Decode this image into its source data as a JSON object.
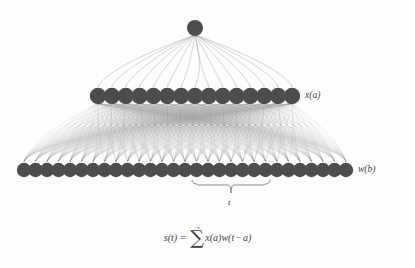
{
  "figure": {
    "background_color": "#fdfdfd",
    "node_color": "#4d4d4d",
    "edge_color": "#8c8c8c",
    "text_color": "#3f3f3f"
  },
  "layers": {
    "output": {
      "name": "output-node",
      "count": 1,
      "center_x": 195,
      "y": 28,
      "radius": 8
    },
    "middle": {
      "name": "x-layer",
      "label": "x(a)",
      "count": 15,
      "x_start": 98,
      "x_end": 292,
      "y": 96,
      "radius": 8.2
    },
    "bottom": {
      "name": "w-layer",
      "label": "w(b)",
      "count": 29,
      "x_start": 24,
      "x_end": 346,
      "y": 170,
      "radius": 7.2
    }
  },
  "brace": {
    "name": "window-brace",
    "label": "t",
    "x_start": 192,
    "x_end": 270,
    "y_top": 180,
    "y_bottom": 193
  },
  "formula": {
    "lhs": "s(t)",
    "equals": "=",
    "sum_upper": "+∞",
    "sum_glyph": "∑",
    "sum_lower": "−∞",
    "term_x": "x(a)",
    "term_w_open": "w(t",
    "term_minus": "−",
    "term_a_close": "a)",
    "full_text": "s(t) = ∑ from −∞ to +∞ of x(a)w(t − a)"
  }
}
